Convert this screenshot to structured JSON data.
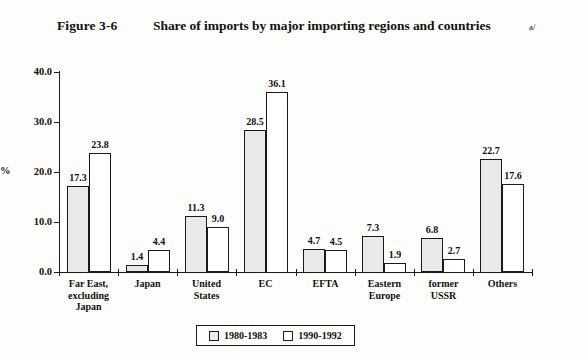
{
  "figure": {
    "number": "Figure 3-6",
    "title": "Share of imports by major importing regions and countries",
    "footnote_marker": "a/"
  },
  "chart_data": {
    "type": "bar",
    "title": "Share of imports by major importing regions and countries",
    "xlabel": "",
    "ylabel": "%",
    "ylim": [
      0,
      40
    ],
    "yticks": [
      "0.0",
      "10.0",
      "20.0",
      "30.0",
      "40.0"
    ],
    "grid": false,
    "legend_position": "bottom-center",
    "categories": [
      "Far East,\nexcluding\nJapan",
      "Japan",
      "United\nStates",
      "EC",
      "EFTA",
      "Eastern\nEurope",
      "former\nUSSR",
      "Others"
    ],
    "series": [
      {
        "name": "1980-1983",
        "values": [
          17.3,
          1.4,
          11.3,
          28.5,
          4.7,
          7.3,
          6.8,
          22.7
        ],
        "labels": [
          "17.3",
          "1.4",
          "11.3",
          "28.5",
          "4.7",
          "7.3",
          "6.8",
          "22.7"
        ],
        "fill": "dotted-gray"
      },
      {
        "name": "1990-1992",
        "values": [
          23.8,
          4.4,
          9.0,
          36.1,
          4.5,
          1.9,
          2.7,
          17.6
        ],
        "labels": [
          "23.8",
          "4.4",
          "9.0",
          "36.1",
          "4.5",
          "1.9",
          "2.7",
          "17.6"
        ],
        "fill": "white"
      }
    ]
  },
  "colors": {
    "axis": "#1a1a1a",
    "series_0_fill": "#e9e9e9",
    "series_1_fill": "#ffffff",
    "background": "#fdfdfc"
  }
}
